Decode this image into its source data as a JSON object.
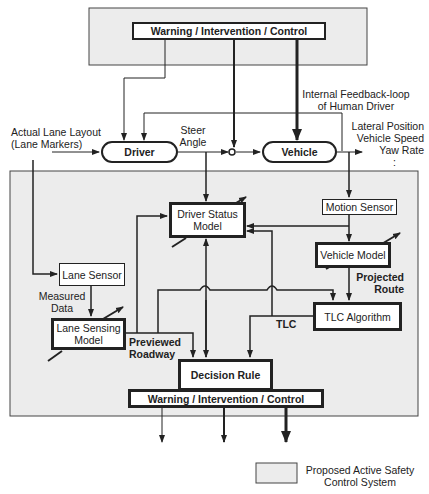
{
  "diagram": {
    "top_region": {
      "warning_box": "Warning / Intervention / Control"
    },
    "inputs": {
      "lane_layout_line1": "Actual Lane Layout",
      "lane_layout_line2": "(Lane Markers)"
    },
    "driver": "Driver",
    "vehicle": "Vehicle",
    "steer_line1": "Steer",
    "steer_line2": "Angle",
    "feedback_line1": "Internal Feedback-loop",
    "feedback_line2": "of Human Driver",
    "outputs": {
      "line1": "Lateral Position",
      "line2": "Vehicle Speed",
      "line3": "Yaw Rate",
      "line4": ":"
    },
    "lower_region": {
      "driver_status_line1": "Driver Status",
      "driver_status_line2": "Model",
      "motion_sensor": "Motion Sensor",
      "vehicle_model": "Vehicle Model",
      "projected_route_line1": "Projected",
      "projected_route_line2": "Route",
      "lane_sensor": "Lane Sensor",
      "measured_data_line1": "Measured",
      "measured_data_line2": "Data",
      "lane_sensing_line1": "Lane Sensing",
      "lane_sensing_line2": "Model",
      "tlc_algorithm": "TLC Algorithm",
      "tlc_label": "TLC",
      "previewed_line1": "Previewed",
      "previewed_line2": "Roadway",
      "decision_rule": "Decision Rule",
      "warning_box": "Warning / Intervention / Control"
    },
    "legend": {
      "line1": "Proposed Active Safety",
      "line2": "Control System",
      "swatch_color": "#ececec"
    },
    "colors": {
      "region_fill": "#ececec",
      "stroke": "#222222"
    }
  }
}
